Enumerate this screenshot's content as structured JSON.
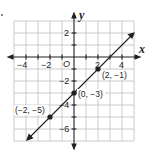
{
  "graph": {
    "x_axis_label": "x",
    "y_axis_label": "y",
    "origin_label": "O",
    "x_ticks": [
      "−4",
      "−2",
      "2",
      "4"
    ],
    "y_ticks": [
      "2",
      "−2",
      "−4",
      "−6"
    ],
    "points": [
      {
        "label": "(2, −1)",
        "x": 2,
        "y": -1
      },
      {
        "label": "(0, −3)",
        "x": 0,
        "y": -3
      },
      {
        "label": "(−2, −5)",
        "x": -2,
        "y": -5
      }
    ],
    "line": {
      "slope": 1,
      "intercept": -3,
      "equation": "y = x − 3"
    },
    "grid": {
      "xmin": -5,
      "xmax": 5,
      "ymin": -7,
      "ymax": 3
    }
  }
}
